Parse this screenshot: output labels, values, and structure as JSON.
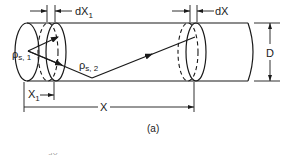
{
  "figure": {
    "panel_label": "(a)",
    "colors": {
      "ink": "#1a1a1a",
      "background": "#ffffff"
    },
    "labels": {
      "dx1": "dX",
      "dx1_sub": "1",
      "dx": "dX",
      "diameter": "D",
      "rho_s1": "ρ",
      "rho_s1_sub": "s, 1",
      "rho_s2": "ρ",
      "rho_s2_sub": "s, 2",
      "x1": "X",
      "x1_sub": "1",
      "x": "X",
      "cropped_bottom": "dX"
    }
  }
}
